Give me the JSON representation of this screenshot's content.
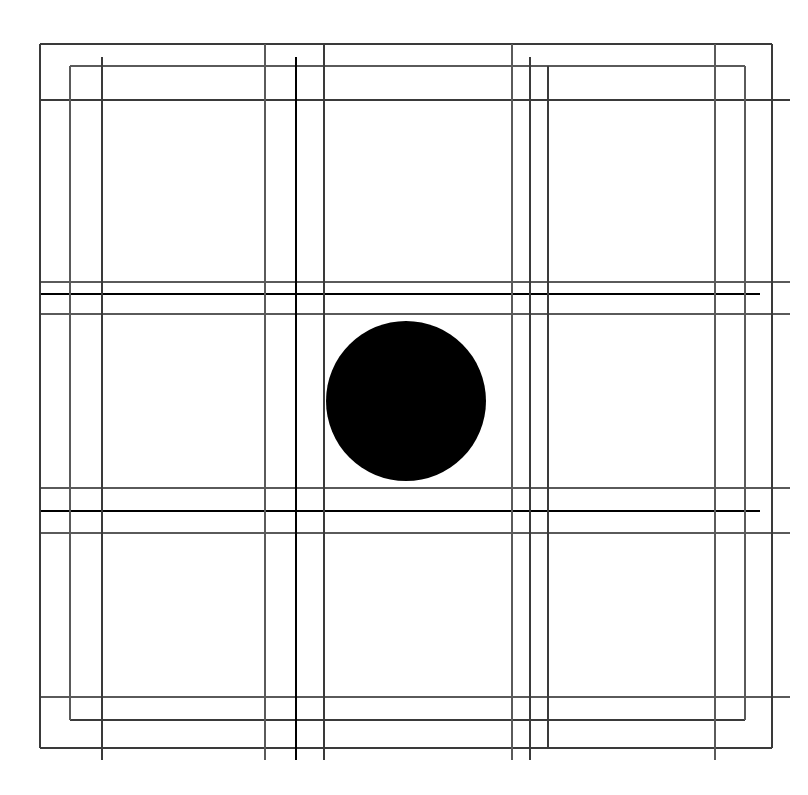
{
  "canvas": {
    "width": 808,
    "height": 795,
    "background": "#ffffff",
    "title": "Geometric Grid Composition"
  },
  "palette": {
    "fine": "#6b6b6b",
    "light": "#5a5a5a",
    "medium": "#3a3a3a",
    "bold": "#141414",
    "heavy": "#000000",
    "circle": "#555555",
    "background": "#ffffff"
  },
  "chart_data": {
    "type": "line",
    "subtitle": "",
    "xlabel": "",
    "ylabel": "",
    "grid": true,
    "legend": "none",
    "xlim": [
      0,
      808
    ],
    "ylim": [
      0,
      795
    ],
    "vertical_rules": [
      {
        "id": "v1",
        "x": 40,
        "y1": 44,
        "y2": 748,
        "weight": "medium"
      },
      {
        "id": "v2",
        "x": 70,
        "y1": 66,
        "y2": 720,
        "weight": "light"
      },
      {
        "id": "v3",
        "x": 102,
        "y1": 57,
        "y2": 760,
        "weight": "medium"
      },
      {
        "id": "v4",
        "x": 265,
        "y1": 44,
        "y2": 760,
        "weight": "light"
      },
      {
        "id": "v5",
        "x": 296,
        "y1": 57,
        "y2": 760,
        "weight": "heavy"
      },
      {
        "id": "v6",
        "x": 324,
        "y1": 44,
        "y2": 760,
        "weight": "medium"
      },
      {
        "id": "v7",
        "x": 512,
        "y1": 44,
        "y2": 760,
        "weight": "light"
      },
      {
        "id": "v8",
        "x": 530,
        "y1": 57,
        "y2": 760,
        "weight": "medium"
      },
      {
        "id": "v9",
        "x": 548,
        "y1": 66,
        "y2": 748,
        "weight": "medium"
      },
      {
        "id": "v10",
        "x": 715,
        "y1": 44,
        "y2": 760,
        "weight": "light"
      },
      {
        "id": "v11",
        "x": 745,
        "y1": 66,
        "y2": 720,
        "weight": "light"
      },
      {
        "id": "v12",
        "x": 772,
        "y1": 44,
        "y2": 748,
        "weight": "medium"
      }
    ],
    "horizontal_rules": [
      {
        "id": "h1",
        "y": 44,
        "x1": 40,
        "x2": 772,
        "weight": "medium"
      },
      {
        "id": "h2",
        "y": 66,
        "x1": 70,
        "x2": 745,
        "weight": "light"
      },
      {
        "id": "h3",
        "y": 100,
        "x1": 40,
        "x2": 790,
        "weight": "medium"
      },
      {
        "id": "h4",
        "y": 282,
        "x1": 40,
        "x2": 790,
        "weight": "light"
      },
      {
        "id": "h5",
        "y": 294,
        "x1": 40,
        "x2": 760,
        "weight": "heavy"
      },
      {
        "id": "h6",
        "y": 314,
        "x1": 40,
        "x2": 790,
        "weight": "light"
      },
      {
        "id": "h7",
        "y": 488,
        "x1": 40,
        "x2": 790,
        "weight": "light"
      },
      {
        "id": "h8",
        "y": 511,
        "x1": 40,
        "x2": 760,
        "weight": "heavy"
      },
      {
        "id": "h9",
        "y": 533,
        "x1": 40,
        "x2": 790,
        "weight": "light"
      },
      {
        "id": "h10",
        "y": 697,
        "x1": 40,
        "x2": 790,
        "weight": "light"
      },
      {
        "id": "h11",
        "y": 720,
        "x1": 70,
        "x2": 745,
        "weight": "medium"
      },
      {
        "id": "h12",
        "y": 748,
        "x1": 40,
        "x2": 772,
        "weight": "medium"
      }
    ],
    "circle": {
      "cx": 406,
      "cy": 401,
      "r": 80,
      "weight": "circle",
      "fill": "none"
    },
    "stroke_weights": {
      "fine": 1.0,
      "light": 1.1,
      "medium": 1.5,
      "bold": 2.4,
      "heavy": 2.9,
      "circle": 1.2
    }
  }
}
